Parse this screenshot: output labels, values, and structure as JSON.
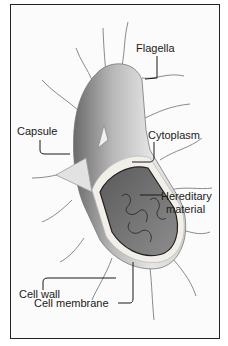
{
  "diagram": {
    "labels": {
      "flagella": "Flagella",
      "capsule": "Capsule",
      "cytoplasm": "Cytoplasm",
      "hereditary_line1": "Hereditary",
      "hereditary_line2": "material",
      "cell_wall": "Cell wall",
      "cell_membrane": "Cell membrane"
    }
  }
}
